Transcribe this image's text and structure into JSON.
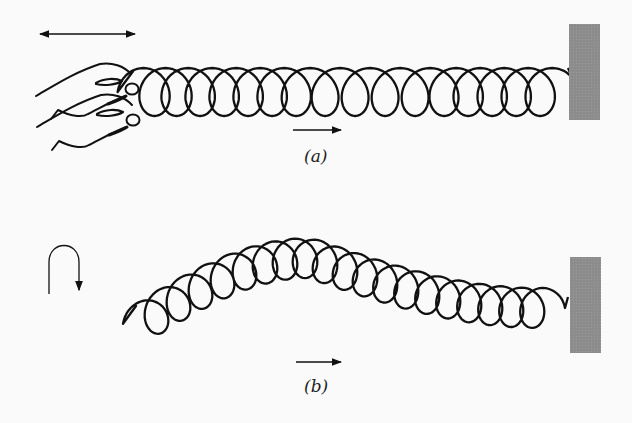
{
  "figure": {
    "panels": [
      {
        "id": "a",
        "label": "(a)",
        "description": "Hand moving spring end back and forth horizontally: longitudinal wave",
        "motion_indicator": "double-headed horizontal arrow",
        "propagation_arrow": "right"
      },
      {
        "id": "b",
        "label": "(b)",
        "description": "Hand moving spring end up and down: transverse wave pulse",
        "motion_indicator": "curved up-down arrow",
        "propagation_arrow": "right"
      }
    ],
    "colors": {
      "background": "#fafafa",
      "ink": "#111111",
      "wall": "#8c8c8c"
    }
  }
}
